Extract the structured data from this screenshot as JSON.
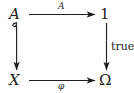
{
  "diagram": {
    "type": "commutative-square",
    "nodes": [
      {
        "id": "top-left",
        "label": "A",
        "style": "italic"
      },
      {
        "id": "top-right",
        "label": "1",
        "style": "upright"
      },
      {
        "id": "bottom-left",
        "label": "X",
        "style": "italic"
      },
      {
        "id": "bottom-right",
        "label": "Ω",
        "style": "upright"
      }
    ],
    "arrows": [
      {
        "id": "top",
        "from": "top-left",
        "to": "top-right",
        "label": "A",
        "label_style": "italic",
        "head": "normal",
        "tail": "plain"
      },
      {
        "id": "left",
        "from": "top-left",
        "to": "bottom-left",
        "label": "",
        "label_style": "italic",
        "head": "normal",
        "tail": "hook"
      },
      {
        "id": "right",
        "from": "top-right",
        "to": "bottom-right",
        "label": "true",
        "label_style": "upright",
        "head": "normal",
        "tail": "plain"
      },
      {
        "id": "bottom",
        "from": "bottom-left",
        "to": "bottom-right",
        "label": "φ",
        "label_style": "italic",
        "head": "normal",
        "tail": "plain"
      }
    ],
    "colors": {
      "ink": "#1f1f1f",
      "background": "#ffffff"
    }
  }
}
